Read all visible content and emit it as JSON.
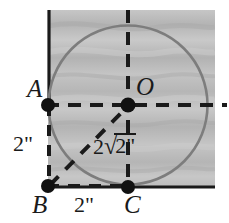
{
  "figure": {
    "background_color": "#ffffff",
    "shade_color": "#b9b9b9",
    "line_color": "#1a1a1a",
    "circle_stroke_color": "#7d7d7d",
    "labels": {
      "point_a": "A",
      "point_b": "B",
      "point_c": "C",
      "point_o": "O",
      "measure_left": "2\"",
      "measure_bottom": "2\"",
      "measure_diagonal_coefficient": "2",
      "measure_diagonal_radical_sign": "√",
      "measure_diagonal_radicand": "2\""
    },
    "geometry": {
      "square_left": 48,
      "square_top": 10,
      "square_right": 215,
      "square_bottom": 187,
      "circle_center_x": 128,
      "circle_center_y": 105,
      "circle_radius": 80,
      "point_a_x": 48,
      "point_a_y": 105,
      "point_b_x": 48,
      "point_b_y": 186,
      "point_c_x": 128,
      "point_c_y": 187,
      "point_o_x": 128,
      "point_o_y": 105,
      "dot_radius": 7
    }
  }
}
